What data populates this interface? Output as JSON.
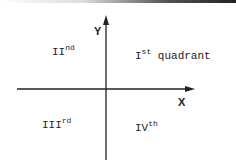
{
  "diagram": {
    "type": "cartesian-quadrants",
    "axes": {
      "x_label": "X",
      "y_label": "Y"
    },
    "quadrants": [
      {
        "id": "q1",
        "numeral": "I",
        "suffix": "st",
        "extra": "quadrant"
      },
      {
        "id": "q2",
        "numeral": "II",
        "suffix": "nd",
        "extra": ""
      },
      {
        "id": "q3",
        "numeral": "III",
        "suffix": "rd",
        "extra": ""
      },
      {
        "id": "q4",
        "numeral": "IV",
        "suffix": "th",
        "extra": ""
      }
    ]
  }
}
